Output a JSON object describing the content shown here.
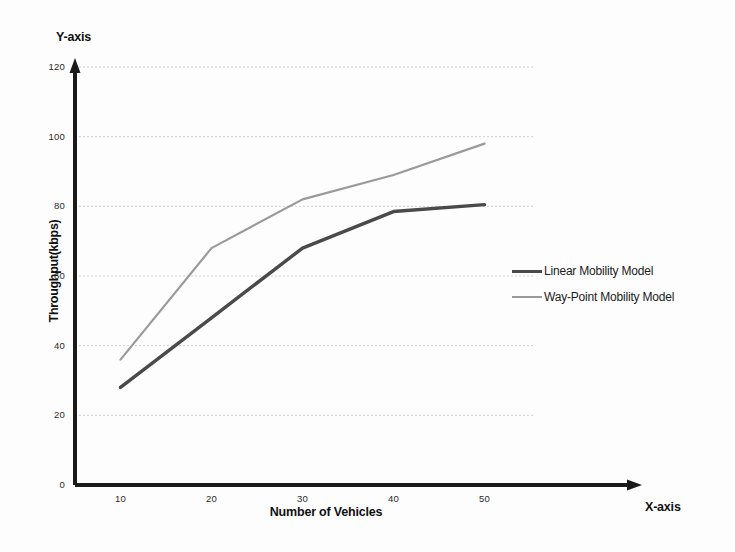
{
  "axis_names": {
    "y": "Y-axis",
    "x": "X-axis"
  },
  "labels": {
    "y_title": "Throughput(kbps)",
    "x_title": "Number of Vehicles"
  },
  "legend": {
    "items": [
      {
        "label": "Linear Mobility Model",
        "color": "#4a4a4a",
        "width": "thick"
      },
      {
        "label": "Way-Point Mobility Model",
        "color": "#9a9a9a",
        "width": "thin"
      }
    ]
  },
  "colors": {
    "linear": "#4a4a4a",
    "waypoint": "#9a9a9a",
    "axis": "#1a1a1a",
    "grid": "#cfcfcf",
    "background": "#fdfdfd"
  },
  "chart_data": {
    "type": "line",
    "title": "",
    "xlabel": "Number of Vehicles",
    "ylabel": "Throughput(kbps)",
    "x": [
      10,
      20,
      30,
      40,
      50
    ],
    "xticks": [
      "10",
      "20",
      "30",
      "40",
      "50"
    ],
    "yticks": [
      "0",
      "20",
      "40",
      "60",
      "80",
      "100",
      "120"
    ],
    "xlim": [
      5,
      55
    ],
    "ylim": [
      0,
      120
    ],
    "grid": true,
    "grid_axis": "y",
    "legend_position": "right",
    "series": [
      {
        "name": "Linear Mobility Model",
        "color": "#4a4a4a",
        "values": [
          28,
          48,
          68,
          78.5,
          80.5
        ]
      },
      {
        "name": "Way-Point Mobility Model",
        "color": "#9a9a9a",
        "values": [
          36,
          68,
          82,
          89,
          98
        ]
      }
    ]
  }
}
